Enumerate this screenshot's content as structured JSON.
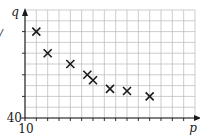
{
  "chart_data": {
    "type": "scatter",
    "title": "",
    "xlabel": "p",
    "ylabel": "q",
    "x_origin_label": "10",
    "y_origin_label": "40",
    "xlim": [
      10,
      25
    ],
    "ylim": [
      40,
      50
    ],
    "x_grid_step": 1,
    "y_grid_step": 1,
    "y_major_tick_every": 2,
    "x_major_tick_every": 1,
    "grid": true,
    "legend": "none",
    "marker": "x",
    "points": [
      {
        "x": 11,
        "y": 48
      },
      {
        "x": 12,
        "y": 46
      },
      {
        "x": 14,
        "y": 45
      },
      {
        "x": 15.5,
        "y": 44
      },
      {
        "x": 16,
        "y": 43.5
      },
      {
        "x": 17.5,
        "y": 42.7
      },
      {
        "x": 19,
        "y": 42.5
      },
      {
        "x": 21,
        "y": 42
      }
    ]
  },
  "edge_glyph": "/"
}
